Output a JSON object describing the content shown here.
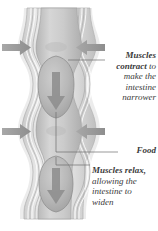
{
  "figure": {
    "type": "anatomical-diagram",
    "palette": {
      "background": "#ffffff",
      "tube_outer": "#d8d8d8",
      "tube_wall": "#bdbdbd",
      "tube_lumen": "#cfcfcf",
      "bolus": "#b6b6b6",
      "bolus_outline": "#8f8f8f",
      "arrow_gray": "#9a9a9a",
      "bolus_arrow": "#8c8c8c",
      "leader_line": "#6e6e6e",
      "text": "#3a3a3a"
    }
  },
  "callouts": {
    "contract": {
      "lead": "Muscles contract",
      "rest": " to make the intestine narrower",
      "full": "Muscles contract to make the intestine narrower"
    },
    "food": {
      "label": "Food"
    },
    "relax": {
      "lead": "Muscles relax,",
      "rest": " allowing the intestine to widen",
      "full": "Muscles relax, allowing the intestine to widen"
    }
  },
  "icons": {
    "left_arrow_top": "arrow-right-icon",
    "right_arrow_top": "arrow-left-icon",
    "left_arrow_bottom": "arrow-right-icon",
    "right_arrow_bottom": "arrow-left-icon",
    "bolus_arrow_upper": "arrow-down-icon",
    "bolus_arrow_lower": "arrow-down-icon"
  }
}
